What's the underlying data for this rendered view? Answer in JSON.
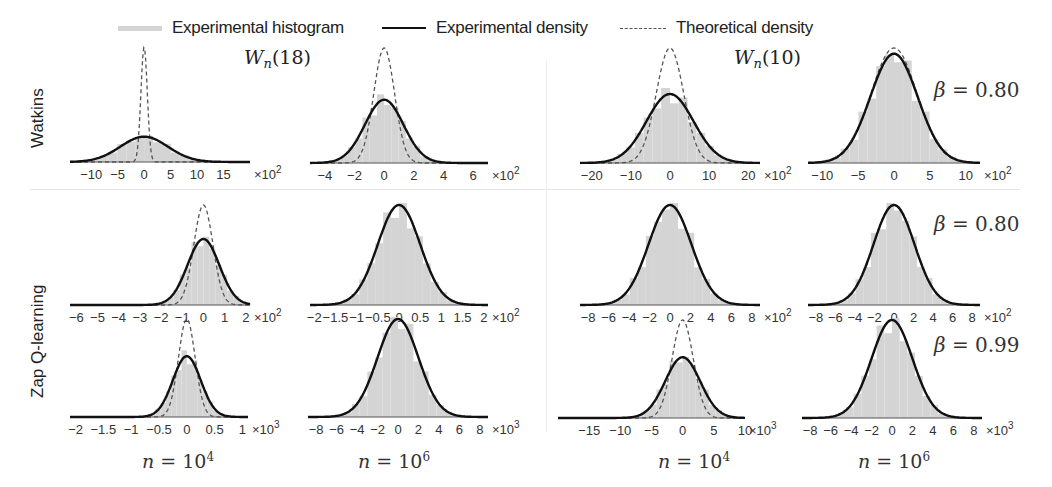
{
  "legend": {
    "histogram": "Experimental histogram",
    "experimental": "Experimental density",
    "theoretical": "Theoretical density"
  },
  "row_labels": {
    "watkins": "Watkins",
    "zap": "Zap Q-learning"
  },
  "titles": {
    "left": {
      "w": "W",
      "sub": "n",
      "arg": "(18)"
    },
    "right": {
      "w": "W",
      "sub": "n",
      "arg": "(10)"
    }
  },
  "beta_labels": [
    {
      "sym": "β",
      "text": " = 0.80"
    },
    {
      "sym": "β",
      "text": " = 0.80"
    },
    {
      "sym": "β",
      "text": " = 0.99"
    }
  ],
  "n_labels": [
    {
      "sym": "n",
      "eq": " = 10",
      "exp": "4"
    },
    {
      "sym": "n",
      "eq": " = 10",
      "exp": "6"
    },
    {
      "sym": "n",
      "eq": " = 10",
      "exp": "4"
    },
    {
      "sym": "n",
      "eq": " = 10",
      "exp": "6"
    }
  ],
  "colors": {
    "histogram": "#d4d4d4",
    "experimental": "#111111",
    "theoretical": "#555555"
  },
  "chart_data": [
    {
      "type": "bar",
      "title": "Watkins W_n(18), n=10^4",
      "xlabel": "×10^2",
      "ticks": [
        "-10",
        "-5",
        "0",
        "5",
        "10",
        "15"
      ],
      "xlim": [
        -14,
        20
      ],
      "series": [
        {
          "name": "Experimental density",
          "mean": 0,
          "std": 4.5,
          "peak": 0.22
        },
        {
          "name": "Theoretical density",
          "mean": 0,
          "std": 0.6,
          "peak": 1.0
        }
      ]
    },
    {
      "type": "bar",
      "title": "Watkins W_n(18), n=10^6",
      "xlabel": "×10^2",
      "ticks": [
        "-4",
        "-2",
        "0",
        "2",
        "4",
        "6"
      ],
      "xlim": [
        -5,
        7
      ],
      "series": [
        {
          "name": "Experimental density",
          "mean": 0,
          "std": 1.3,
          "peak": 0.55
        },
        {
          "name": "Theoretical density",
          "mean": 0,
          "std": 0.7,
          "peak": 1.0
        }
      ]
    },
    {
      "type": "bar",
      "title": "Watkins W_n(10), n=10^4",
      "xlabel": "×10^2",
      "ticks": [
        "-20",
        "-10",
        "0",
        "10",
        "20"
      ],
      "xlim": [
        -23,
        23
      ],
      "series": [
        {
          "name": "Experimental density",
          "mean": 0,
          "std": 6,
          "peak": 0.6
        },
        {
          "name": "Theoretical density",
          "mean": 0,
          "std": 3.5,
          "peak": 1.0
        }
      ]
    },
    {
      "type": "bar",
      "title": "Watkins W_n(10), n=10^6 (β=0.80)",
      "xlabel": "×10^2",
      "ticks": [
        "-10",
        "-5",
        "0",
        "5",
        "10"
      ],
      "xlim": [
        -12,
        12
      ],
      "series": [
        {
          "name": "Experimental density",
          "mean": 0,
          "std": 3.3,
          "peak": 0.95
        },
        {
          "name": "Theoretical density",
          "mean": 0,
          "std": 3.2,
          "peak": 1.0
        }
      ]
    },
    {
      "type": "bar",
      "title": "Zap Q-learning W_n(18), n=10^4, β=0.80",
      "xlabel": "×10^2",
      "ticks": [
        "-6",
        "-5",
        "-4",
        "-3",
        "-2",
        "-1",
        "0",
        "1",
        "2"
      ],
      "xlim": [
        -6.3,
        2.2
      ],
      "series": [
        {
          "name": "Experimental density",
          "mean": 0,
          "std": 0.75,
          "peak": 0.66
        },
        {
          "name": "Theoretical density",
          "mean": 0,
          "std": 0.45,
          "peak": 1.0
        }
      ]
    },
    {
      "type": "bar",
      "title": "Zap Q-learning W_n(18), n=10^6, β=0.80",
      "xlabel": "×10^2",
      "ticks": [
        "-2",
        "-1.5",
        "-1",
        "-0.5",
        "0",
        "0.5",
        "1",
        "1.5",
        "2"
      ],
      "xlim": [
        -2.1,
        2.1
      ],
      "series": [
        {
          "name": "Experimental density",
          "mean": 0,
          "std": 0.5,
          "peak": 1.0
        },
        {
          "name": "Theoretical density",
          "mean": 0,
          "std": 0.5,
          "peak": 1.0
        }
      ]
    },
    {
      "type": "bar",
      "title": "Zap Q-learning W_n(10), n=10^4, β=0.80",
      "xlabel": "×10^2",
      "ticks": [
        "-8",
        "-6",
        "-4",
        "-2",
        "0",
        "2",
        "4",
        "6",
        "8"
      ],
      "xlim": [
        -8.8,
        8.8
      ],
      "series": [
        {
          "name": "Experimental density",
          "mean": 0,
          "std": 2.1,
          "peak": 1.0
        },
        {
          "name": "Theoretical density",
          "mean": 0,
          "std": 2.1,
          "peak": 1.0
        }
      ]
    },
    {
      "type": "bar",
      "title": "Zap Q-learning W_n(10), n=10^6, β=0.80",
      "xlabel": "×10^2",
      "ticks": [
        "-8",
        "-6",
        "-4",
        "-2",
        "0",
        "2",
        "4",
        "6",
        "8"
      ],
      "xlim": [
        -8.8,
        8.8
      ],
      "series": [
        {
          "name": "Experimental density",
          "mean": 0,
          "std": 2.1,
          "peak": 1.0
        },
        {
          "name": "Theoretical density",
          "mean": 0,
          "std": 2.1,
          "peak": 1.0
        }
      ]
    },
    {
      "type": "bar",
      "title": "Zap Q-learning W_n(18), n=10^4, β=0.99",
      "xlabel": "×10^3",
      "ticks": [
        "-2",
        "-1.5",
        "-1",
        "-0.5",
        "0",
        "0.5",
        "1"
      ],
      "xlim": [
        -2.1,
        1.1
      ],
      "series": [
        {
          "name": "Experimental density",
          "mean": 0,
          "std": 0.25,
          "peak": 0.62
        },
        {
          "name": "Theoretical density",
          "mean": 0,
          "std": 0.15,
          "peak": 1.0
        }
      ]
    },
    {
      "type": "bar",
      "title": "Zap Q-learning W_n(18), n=10^6, β=0.99",
      "xlabel": "×10^3",
      "ticks": [
        "-8",
        "-6",
        "-4",
        "-2",
        "0",
        "2",
        "4",
        "6",
        "8"
      ],
      "xlim": [
        -8.8,
        8.8
      ],
      "series": [
        {
          "name": "Experimental density",
          "mean": 0,
          "std": 2.0,
          "peak": 1.0
        },
        {
          "name": "Theoretical density",
          "mean": 0,
          "std": 2.0,
          "peak": 1.0
        }
      ]
    },
    {
      "type": "bar",
      "title": "Zap Q-learning W_n(10), n=10^4, β=0.99",
      "xlabel": "×10^3",
      "ticks": [
        "-15",
        "-10",
        "-5",
        "0",
        "5",
        "10"
      ],
      "xlim": [
        -20,
        10
      ],
      "series": [
        {
          "name": "Experimental density",
          "mean": 0,
          "std": 2.8,
          "peak": 0.62
        },
        {
          "name": "Theoretical density",
          "mean": 0,
          "std": 1.7,
          "peak": 1.0
        }
      ]
    },
    {
      "type": "bar",
      "title": "Zap Q-learning W_n(10), n=10^6, β=0.99",
      "xlabel": "×10^3",
      "ticks": [
        "-8",
        "-6",
        "-4",
        "-2",
        "0",
        "2",
        "4",
        "6",
        "8"
      ],
      "xlim": [
        -8.8,
        8.8
      ],
      "series": [
        {
          "name": "Experimental density",
          "mean": 0,
          "std": 2.0,
          "peak": 1.0
        },
        {
          "name": "Theoretical density",
          "mean": 0,
          "std": 2.0,
          "peak": 1.0
        }
      ]
    }
  ]
}
